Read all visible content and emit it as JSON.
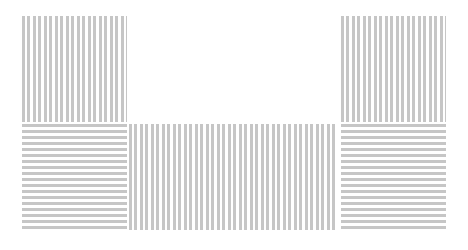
{
  "pattern": {
    "stripe_color": "#c6c6c6",
    "background_color": "#ffffff",
    "blocks": [
      {
        "id": "top-left",
        "orientation": "vertical"
      },
      {
        "id": "top-right",
        "orientation": "vertical"
      },
      {
        "id": "bottom-left",
        "orientation": "horizontal"
      },
      {
        "id": "bottom-center",
        "orientation": "vertical"
      },
      {
        "id": "bottom-right",
        "orientation": "horizontal"
      }
    ]
  }
}
